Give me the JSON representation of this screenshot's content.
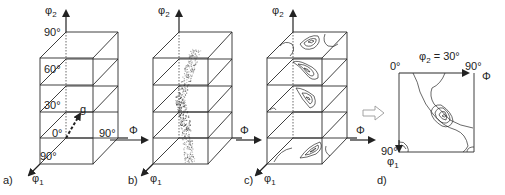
{
  "figure": {
    "panels": [
      {
        "id": "a",
        "label": "a)",
        "axes": {
          "vertical": "φ2",
          "depth": "φ1",
          "horizontal": "Φ"
        },
        "tick_labels": [
          "90°",
          "60°",
          "30°",
          "0°",
          "90°",
          "90°"
        ],
        "vector_label": "g"
      },
      {
        "id": "b",
        "label": "b)",
        "axes": {
          "vertical": "φ2",
          "depth": "φ1",
          "horizontal": "Φ"
        },
        "content": "scatter of orientation points"
      },
      {
        "id": "c",
        "label": "c)",
        "axes": {
          "vertical": "φ2",
          "depth": "φ1",
          "horizontal": "Φ"
        },
        "content": "contour sections at φ2 = 0°, 30°, 60°, 90°"
      },
      {
        "id": "d",
        "label": "d)",
        "section_title": "φ2 = 30°",
        "axes": {
          "horizontal": "Φ",
          "vertical": "φ1"
        },
        "tick_labels": {
          "origin": "0°",
          "phi_max": "90°",
          "phi1_max": "90°"
        }
      }
    ]
  },
  "labels": {
    "a_phi2": "φ",
    "a_phi2_sub": "2",
    "a_t90": "90°",
    "a_t60": "60°",
    "a_t30": "30°",
    "a_t0": "0°",
    "a_g": "g",
    "a_phi1_t90": "90°",
    "a_Phi_t90": "90°",
    "a_label": "a)",
    "a_phi1": "φ",
    "a_phi1_sub": "1",
    "ab_Phi": "Φ",
    "b_phi2": "φ",
    "b_phi2_sub": "2",
    "b_label": "b)",
    "b_phi1": "φ",
    "b_phi1_sub": "1",
    "bc_Phi": "Φ",
    "c_phi2": "φ",
    "c_phi2_sub": "2",
    "c_label": "c)",
    "c_phi1": "φ",
    "c_phi1_sub": "1",
    "cd_Phi": "Φ",
    "d_title": "φ",
    "d_title_sub": "2",
    "d_title_rest": " = 30°",
    "d_t0": "0°",
    "d_t90": "90°",
    "d_Phi": "Φ",
    "d_phi1_t90": "90°",
    "d_phi1": "φ",
    "d_phi1_sub": "1",
    "d_label": "d)"
  },
  "colors": {
    "line": "#2a2a2a",
    "scatter": "#333333",
    "hollow_arrow": "#9a9a9a"
  }
}
